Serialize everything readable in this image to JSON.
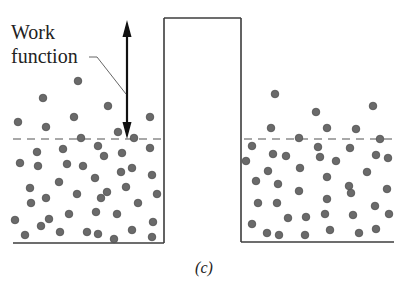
{
  "diagram": {
    "label_line1": "Work",
    "label_line2": "function",
    "caption": "(c)",
    "colors": {
      "wall": "#3c3c3c",
      "fermi_level_dash": "#8c8c8c",
      "arrow": "#111111",
      "electron": "#6a6a6a"
    },
    "left_metal": {
      "name": "left-metal-well",
      "bottom_y": 243,
      "x_start": 13,
      "x_end": 164,
      "fermi_level_y": 139,
      "electrons": [
        [
          78,
          81
        ],
        [
          43,
          98
        ],
        [
          108,
          106
        ],
        [
          18,
          122
        ],
        [
          74,
          117
        ],
        [
          46,
          127
        ],
        [
          150,
          117
        ],
        [
          118,
          132
        ],
        [
          81,
          138
        ],
        [
          134,
          138
        ],
        [
          37,
          152
        ],
        [
          63,
          149
        ],
        [
          98,
          146
        ],
        [
          150,
          148
        ],
        [
          104,
          156
        ],
        [
          122,
          153
        ],
        [
          20,
          163
        ],
        [
          38,
          166
        ],
        [
          67,
          164
        ],
        [
          83,
          166
        ],
        [
          121,
          172
        ],
        [
          132,
          168
        ],
        [
          152,
          175
        ],
        [
          59,
          182
        ],
        [
          95,
          178
        ],
        [
          30,
          188
        ],
        [
          77,
          194
        ],
        [
          107,
          192
        ],
        [
          126,
          187
        ],
        [
          157,
          194
        ],
        [
          46,
          198
        ],
        [
          101,
          198
        ],
        [
          31,
          203
        ],
        [
          138,
          203
        ],
        [
          69,
          214
        ],
        [
          96,
          212
        ],
        [
          117,
          214
        ],
        [
          15,
          220
        ],
        [
          49,
          219
        ],
        [
          153,
          222
        ],
        [
          41,
          226
        ],
        [
          60,
          232
        ],
        [
          87,
          232
        ],
        [
          98,
          234
        ],
        [
          132,
          230
        ],
        [
          25,
          235
        ],
        [
          114,
          239
        ],
        [
          152,
          237
        ]
      ]
    },
    "barrier": {
      "x_left": 164,
      "x_right": 241,
      "top_y": 18
    },
    "right_metal": {
      "name": "right-metal-well",
      "bottom_y": 242,
      "x_start": 241,
      "x_end": 394,
      "fermi_level_y": 139,
      "electrons": [
        [
          275,
          94
        ],
        [
          373,
          106
        ],
        [
          316,
          112
        ],
        [
          271,
          128
        ],
        [
          327,
          128
        ],
        [
          356,
          129
        ],
        [
          299,
          138
        ],
        [
          380,
          139
        ],
        [
          252,
          146
        ],
        [
          318,
          147
        ],
        [
          350,
          148
        ],
        [
          273,
          154
        ],
        [
          286,
          156
        ],
        [
          320,
          157
        ],
        [
          376,
          155
        ],
        [
          388,
          158
        ],
        [
          246,
          161
        ],
        [
          336,
          161
        ],
        [
          268,
          171
        ],
        [
          300,
          168
        ],
        [
          367,
          172
        ],
        [
          327,
          177
        ],
        [
          256,
          181
        ],
        [
          278,
          184
        ],
        [
          349,
          186
        ],
        [
          299,
          191
        ],
        [
          351,
          193
        ],
        [
          387,
          189
        ],
        [
          327,
          199
        ],
        [
          258,
          203
        ],
        [
          277,
          203
        ],
        [
          375,
          206
        ],
        [
          288,
          218
        ],
        [
          306,
          217
        ],
        [
          325,
          214
        ],
        [
          353,
          215
        ],
        [
          389,
          214
        ],
        [
          252,
          224
        ],
        [
          267,
          233
        ],
        [
          279,
          235
        ],
        [
          305,
          235
        ],
        [
          330,
          230
        ],
        [
          359,
          233
        ],
        [
          376,
          229
        ]
      ]
    },
    "work_function_arrow": {
      "x": 127,
      "y_top": 20,
      "y_bottom": 139,
      "style": "double-headed"
    },
    "leader_line": [
      [
        89,
        57
      ],
      [
        97,
        57
      ],
      [
        126,
        94
      ]
    ]
  }
}
